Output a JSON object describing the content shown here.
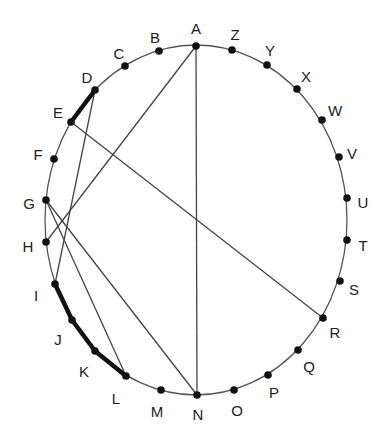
{
  "diagram": {
    "type": "circle-chord-diagram",
    "colors": {
      "stroke": "#444444",
      "dot": "#111111",
      "label": "#222222",
      "background": "#ffffff"
    },
    "points": [
      {
        "id": "A",
        "x": 196,
        "y": 46,
        "lx": 196,
        "ly": 30
      },
      {
        "id": "Z",
        "x": 232,
        "y": 50,
        "lx": 235,
        "ly": 36
      },
      {
        "id": "Y",
        "x": 267,
        "y": 65,
        "lx": 270,
        "ly": 52
      },
      {
        "id": "X",
        "x": 297,
        "y": 89,
        "lx": 306,
        "ly": 78
      },
      {
        "id": "W",
        "x": 322,
        "y": 120,
        "lx": 335,
        "ly": 112
      },
      {
        "id": "V",
        "x": 339,
        "y": 157,
        "lx": 352,
        "ly": 155
      },
      {
        "id": "U",
        "x": 347,
        "y": 198,
        "lx": 363,
        "ly": 204
      },
      {
        "id": "T",
        "x": 347,
        "y": 240,
        "lx": 363,
        "ly": 247
      },
      {
        "id": "S",
        "x": 340,
        "y": 281,
        "lx": 354,
        "ly": 291
      },
      {
        "id": "R",
        "x": 323,
        "y": 318,
        "lx": 335,
        "ly": 334
      },
      {
        "id": "Q",
        "x": 298,
        "y": 350,
        "lx": 309,
        "ly": 368
      },
      {
        "id": "P",
        "x": 268,
        "y": 375,
        "lx": 274,
        "ly": 394
      },
      {
        "id": "O",
        "x": 234,
        "y": 390,
        "lx": 237,
        "ly": 412
      },
      {
        "id": "N",
        "x": 197,
        "y": 395,
        "lx": 198,
        "ly": 416
      },
      {
        "id": "M",
        "x": 161,
        "y": 390,
        "lx": 157,
        "ly": 413
      },
      {
        "id": "L",
        "x": 126,
        "y": 376,
        "lx": 116,
        "ly": 400
      },
      {
        "id": "K",
        "x": 95,
        "y": 351,
        "lx": 84,
        "ly": 373
      },
      {
        "id": "J",
        "x": 72,
        "y": 320,
        "lx": 58,
        "ly": 341
      },
      {
        "id": "I",
        "x": 55,
        "y": 284,
        "lx": 36,
        "ly": 297
      },
      {
        "id": "H",
        "x": 46,
        "y": 242,
        "lx": 28,
        "ly": 248
      },
      {
        "id": "G",
        "x": 46,
        "y": 200,
        "lx": 29,
        "ly": 205
      },
      {
        "id": "F",
        "x": 54,
        "y": 159,
        "lx": 38,
        "ly": 156
      },
      {
        "id": "E",
        "x": 71,
        "y": 122,
        "lx": 58,
        "ly": 114
      },
      {
        "id": "D",
        "x": 95,
        "y": 90,
        "lx": 87,
        "ly": 79
      },
      {
        "id": "C",
        "x": 125,
        "y": 66,
        "lx": 119,
        "ly": 55
      },
      {
        "id": "B",
        "x": 159,
        "y": 51,
        "lx": 155,
        "ly": 39
      }
    ],
    "chords": [
      {
        "from": "A",
        "to": "H"
      },
      {
        "from": "A",
        "to": "N"
      },
      {
        "from": "D",
        "to": "I"
      },
      {
        "from": "E",
        "to": "R"
      },
      {
        "from": "G",
        "to": "L"
      },
      {
        "from": "G",
        "to": "N"
      }
    ],
    "thick_arcs": [
      {
        "from": "D",
        "to": "E"
      },
      {
        "from": "I",
        "to": "L",
        "through": [
          "J",
          "K"
        ]
      }
    ],
    "circle": {
      "cx": 196,
      "cy": 220,
      "rx": 151,
      "ry": 175
    }
  }
}
